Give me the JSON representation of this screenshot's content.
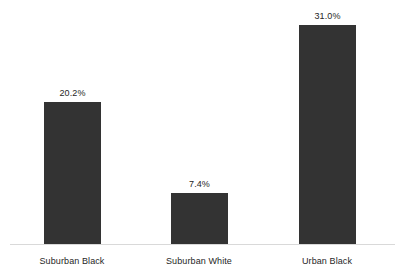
{
  "chart_data": {
    "type": "bar",
    "title": "",
    "subtitle": "",
    "xlabel": "",
    "ylabel": "",
    "categories": [
      "Suburban Black",
      "Suburban White",
      "Urban Black"
    ],
    "values": [
      20.2,
      7.4,
      31.0
    ],
    "value_labels": [
      "20.2%",
      "7.4%",
      "31.0%"
    ],
    "value_unit": "%",
    "ylim": [
      0,
      34.6
    ],
    "grid": false,
    "legend": false,
    "legend_position": "none",
    "y_axis_visible": false,
    "x_axis_line": true,
    "bar_color": "#333333",
    "axis_line_color": "#d9d9d9",
    "label_color": "#262626",
    "background_color": "#ffffff",
    "series": [
      {
        "name": "",
        "values": [
          20.2,
          7.4,
          31.0
        ]
      }
    ]
  }
}
